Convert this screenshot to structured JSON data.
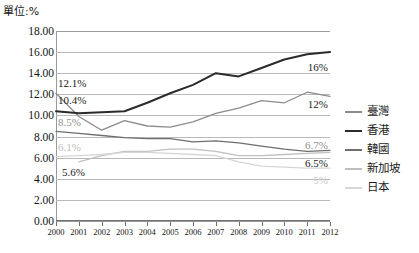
{
  "unit_label": "單位:%",
  "legend": {
    "position": "right",
    "items": [
      {
        "label": "臺灣",
        "color": "#8c8c8c"
      },
      {
        "label": "香港",
        "color": "#2b2b2b"
      },
      {
        "label": "韓國",
        "color": "#6e6e6e"
      },
      {
        "label": "新加坡",
        "color": "#bfbfbf"
      },
      {
        "label": "日本",
        "color": "#d6d6d6"
      }
    ]
  },
  "yticks": [
    "0.00",
    "2.00",
    "4.00",
    "6.00",
    "8.00",
    "10.00",
    "12.00",
    "14.00",
    "16.00",
    "18.00"
  ],
  "xticks": [
    "2000",
    "2001",
    "2002",
    "2003",
    "2004",
    "2005",
    "2006",
    "2007",
    "2008",
    "2009",
    "2010",
    "2011",
    "2012"
  ],
  "annotations": [
    {
      "text": "12.1%",
      "color": "#1a1a1a",
      "x": 58,
      "y": 83,
      "align": "left"
    },
    {
      "text": "10.4%",
      "color": "#1a1a1a",
      "x": 58,
      "y": 100,
      "align": "left"
    },
    {
      "text": "8.5%",
      "color": "#8f8f8f",
      "x": 58,
      "y": 122,
      "align": "left"
    },
    {
      "text": "6.1%",
      "color": "#bdbdbd",
      "x": 58,
      "y": 147,
      "align": "left"
    },
    {
      "text": "5.6%",
      "color": "#1a1a1a",
      "x": 62,
      "y": 172,
      "align": "left"
    },
    {
      "text": "16%",
      "color": "#1a1a1a",
      "x": 328,
      "y": 67,
      "align": "right"
    },
    {
      "text": "12%",
      "color": "#1a1a1a",
      "x": 328,
      "y": 104,
      "align": "right"
    },
    {
      "text": "6.7%",
      "color": "#8f8f8f",
      "x": 328,
      "y": 145,
      "align": "right"
    },
    {
      "text": "6.5%",
      "color": "#1a1a1a",
      "x": 328,
      "y": 163,
      "align": "right"
    },
    {
      "text": "5%",
      "color": "#c9c9c9",
      "x": 328,
      "y": 180,
      "align": "right"
    }
  ],
  "chart_data": {
    "type": "line",
    "title": "",
    "xlabel": "",
    "ylabel": "單位:%",
    "ylim": [
      0,
      18
    ],
    "ytick_step": 2,
    "grid": true,
    "legend_position": "right",
    "x": [
      2000,
      2001,
      2002,
      2003,
      2004,
      2005,
      2006,
      2007,
      2008,
      2009,
      2010,
      2011,
      2012
    ],
    "series": [
      {
        "name": "臺灣",
        "color": "#8c8c8c",
        "values": [
          12.1,
          9.9,
          8.6,
          9.5,
          9.0,
          8.9,
          9.4,
          10.2,
          10.7,
          11.4,
          11.2,
          12.2,
          11.8
        ],
        "first_label": "12.1%",
        "last_label": "12%"
      },
      {
        "name": "香港",
        "color": "#2b2b2b",
        "values": [
          10.4,
          10.2,
          10.3,
          10.4,
          11.2,
          12.1,
          12.9,
          14.0,
          13.7,
          14.5,
          15.3,
          15.8,
          16.0
        ],
        "first_label": "10.4%",
        "last_label": "16%"
      },
      {
        "name": "韓國",
        "color": "#6e6e6e",
        "values": [
          8.5,
          8.3,
          8.1,
          7.9,
          7.8,
          7.8,
          7.5,
          7.6,
          7.4,
          7.1,
          6.8,
          6.6,
          6.7
        ],
        "first_label": "8.5%",
        "last_label": "6.7%"
      },
      {
        "name": "新加坡",
        "color": "#bfbfbf",
        "values": [
          null,
          5.6,
          6.2,
          6.6,
          6.6,
          6.8,
          6.8,
          6.6,
          6.2,
          6.2,
          6.3,
          6.4,
          6.5
        ],
        "first_label": "5.6%",
        "last_label": "6.5%"
      },
      {
        "name": "日本",
        "color": "#d6d6d6",
        "values": [
          6.1,
          6.2,
          6.3,
          6.5,
          6.5,
          6.4,
          6.3,
          6.2,
          5.6,
          5.2,
          5.1,
          5.0,
          5.0
        ],
        "first_label": "6.1%",
        "last_label": "5%"
      }
    ]
  }
}
